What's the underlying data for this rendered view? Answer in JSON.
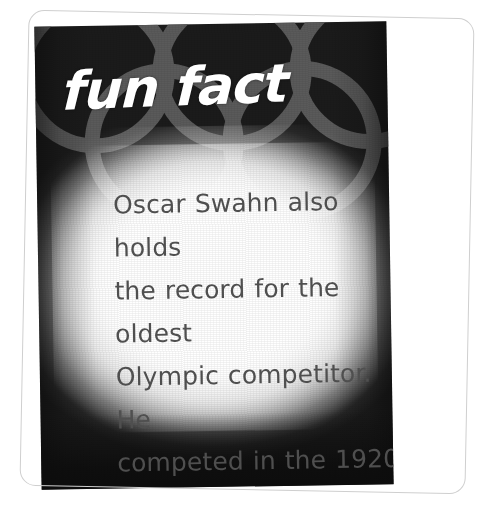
{
  "card": {
    "title": "fun fact",
    "background_color": "#1b1b1b",
    "title_color": "#ffffff",
    "body_text_color": "#4f4f4f",
    "glow_color": "#ffffff",
    "frame_color": "#cfcfcf",
    "ring_color": "#5a5a5a",
    "body": "Oscar Swahn also holds the record for the oldest Olympic competitor. He competed in the 1920 Games when he was 72 years old.",
    "body_lines": [
      "Oscar Swahn also holds",
      "the record for the oldest",
      "Olympic competitor. He",
      "competed in the 1920",
      "Games when he was",
      "72 years old."
    ]
  },
  "graphics": {
    "olympic_rings_icon": "olympic-rings-icon",
    "ring_count": 5
  }
}
